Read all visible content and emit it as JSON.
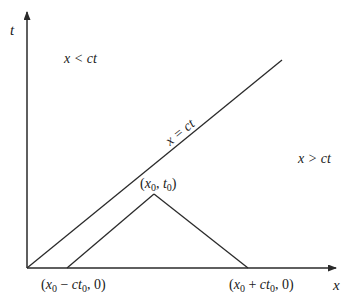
{
  "diagram": {
    "type": "characteristics-xt-plane",
    "axes": {
      "x_label": "x",
      "t_label": "t"
    },
    "regions": {
      "upper_left": "x < ct",
      "lower_right": "x > ct"
    },
    "lines": {
      "characteristic_label": "x = ct"
    },
    "points": {
      "apex": "(x0, t0)",
      "left_foot": "(x0 − ct0, 0)",
      "right_foot": "(x0 + ct0, 0)"
    },
    "colors": {
      "stroke": "#2a2a2a",
      "background": "#ffffff"
    }
  }
}
